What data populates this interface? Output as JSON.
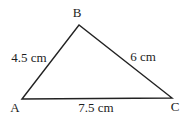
{
  "diagram": {
    "type": "triangle",
    "vertices": [
      {
        "label": "A"
      },
      {
        "label": "B"
      },
      {
        "label": "C"
      }
    ],
    "sides": [
      {
        "from": "A",
        "to": "B",
        "label": "4.5 cm"
      },
      {
        "from": "B",
        "to": "C",
        "label": "6 cm"
      },
      {
        "from": "A",
        "to": "C",
        "label": "7.5 cm"
      }
    ],
    "colors": {
      "stroke": "#222222",
      "text": "#1c1c1c",
      "background": "#ffffff"
    }
  }
}
